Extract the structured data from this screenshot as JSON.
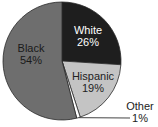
{
  "chart_data": {
    "type": "pie",
    "title": "",
    "categories": [
      "White",
      "Hispanic",
      "Other",
      "Black"
    ],
    "values": [
      26,
      19,
      1,
      54
    ],
    "labels": [
      "White 26%",
      "Hispanic 19%",
      "Other 1%",
      "Black 54%"
    ],
    "colors": [
      "#1e1e1e",
      "#c4c4c4",
      "#ffffff",
      "#6e6e6e"
    ],
    "start_angle": "12 o'clock, clockwise",
    "legend": "none (direct labels)"
  },
  "labels": {
    "white_name": "White",
    "white_pct": "26%",
    "hispanic_name": "Hispanic",
    "hispanic_pct": "19%",
    "other_name": "Other",
    "other_pct": "1%",
    "black_name": "Black",
    "black_pct": "54%"
  }
}
